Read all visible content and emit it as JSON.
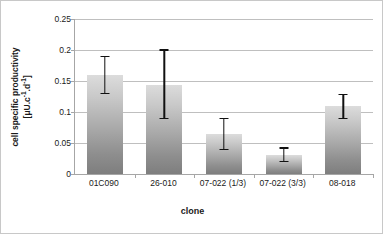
{
  "chart_data": {
    "type": "bar",
    "title": "",
    "subtitle": "",
    "xlabel": "clone",
    "ylabel": "cell specific productivity",
    "ylabel_units": "[μU.c-1.d-1]",
    "ylabel_line1": "cell specific productivity",
    "ylabel_line2_prefix": "[μU.c",
    "ylabel_line2_sup1": "-1",
    "ylabel_line2_mid": ".d",
    "ylabel_line2_sup2": "-1",
    "ylabel_line2_suffix": "]",
    "categories": [
      "01C090",
      "26-010",
      "07-022 (1/3)",
      "07-022 (3/3)",
      "08-018"
    ],
    "values": [
      0.16,
      0.144,
      0.065,
      0.03,
      0.11
    ],
    "error_low": [
      0.13,
      0.09,
      0.04,
      0.02,
      0.09
    ],
    "error_high": [
      0.19,
      0.2,
      0.09,
      0.042,
      0.128
    ],
    "ylim": [
      0,
      0.25
    ],
    "yticks": [
      0,
      0.05,
      0.1,
      0.15,
      0.2,
      0.25
    ],
    "ytick_labels": [
      "0",
      "0.05",
      "0.1",
      "0.15",
      "0.2",
      "0.25"
    ],
    "grid": "horizontal",
    "legend": "none",
    "bar_color_top": "#dcdcdc",
    "bar_color_bottom": "#7e7e7e",
    "error_bar_color": "#111111",
    "gridline_color": "#bfbfbf",
    "axis_color": "#a6a6a6",
    "background_color": "#ffffff"
  }
}
